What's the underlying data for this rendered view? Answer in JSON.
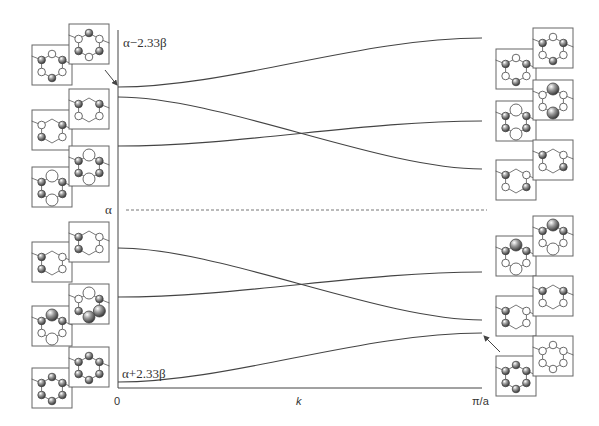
{
  "diagram": {
    "type": "band_structure",
    "axes": {
      "x_label": "k",
      "x_start_label": "0",
      "x_end_label": "π/a",
      "y_top_label": "α−2.33β",
      "y_mid_label": "α",
      "y_bottom_label": "α+2.33β"
    },
    "colors": {
      "line": "#444444",
      "box": "#666666",
      "dashed": "#777777",
      "filled_lobe": "#777777",
      "open_lobe": "#ffffff"
    }
  },
  "chart_data": {
    "type": "line",
    "title": "",
    "xlabel": "k",
    "ylabel": "Energy",
    "x_ticks": [
      "0",
      "π/a"
    ],
    "y_ticks": [
      "α+2.33β",
      "α",
      "α−2.33β"
    ],
    "reference_line": {
      "label": "α",
      "style": "dashed"
    },
    "series": [
      {
        "name": "band-1",
        "start_at_0": "α−2.33β (highest, approx)",
        "y_px_start": 87,
        "y_px_end": 38,
        "trend": "rises"
      },
      {
        "name": "band-2",
        "y_px_start": 97,
        "y_px_end": 169,
        "trend": "falls, crosses band-3"
      },
      {
        "name": "band-3",
        "y_px_start": 146,
        "y_px_end": 121,
        "trend": "rises slightly"
      },
      {
        "name": "band-4",
        "y_px_start": 248,
        "y_px_end": 320,
        "trend": "falls, crosses band-5"
      },
      {
        "name": "band-5",
        "y_px_start": 297,
        "y_px_end": 272,
        "trend": "rises slightly"
      },
      {
        "name": "band-6",
        "start_at_0": "α+2.33β (lowest)",
        "y_px_start": 382,
        "y_px_end": 333,
        "trend": "rises"
      }
    ],
    "grid": false,
    "legend": "none"
  }
}
